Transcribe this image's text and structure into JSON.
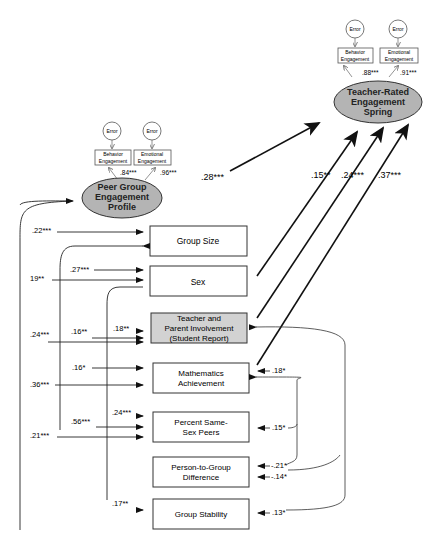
{
  "latent": {
    "peer": {
      "lines": [
        "Peer Group",
        "Engagement",
        "Profile"
      ],
      "fill": "#b4b4b4"
    },
    "teacher": {
      "lines": [
        "Teacher-Rated",
        "Engagement",
        "Spring"
      ],
      "fill": "#b4b4b4"
    }
  },
  "indicators": {
    "peer": [
      {
        "error": "Error",
        "lines": [
          "Behavior",
          "Engagement"
        ],
        "loading": ".84***"
      },
      {
        "error": "Error",
        "lines": [
          "Emotional",
          "Engagement"
        ],
        "loading": ".96***"
      }
    ],
    "teacher": [
      {
        "error": "Error",
        "lines": [
          "Behavior",
          "Engagement"
        ],
        "loading": ".88***"
      },
      {
        "error": "Error",
        "lines": [
          "Emotional",
          "Engagement"
        ],
        "loading": ".91***"
      }
    ]
  },
  "predictors": [
    {
      "lines": [
        "Group Size"
      ],
      "shaded": false
    },
    {
      "lines": [
        "Sex"
      ],
      "shaded": false
    },
    {
      "lines": [
        "Teacher and",
        "Parent Involvement",
        "(Student Report)"
      ],
      "shaded": true,
      "fill": "#d2d2d2"
    },
    {
      "lines": [
        "Mathematics",
        "Achievement"
      ],
      "shaded": false
    },
    {
      "lines": [
        "Percent Same-",
        "Sex Peers"
      ],
      "shaded": false
    },
    {
      "lines": [
        "Person-to-Group",
        "Difference"
      ],
      "shaded": false
    },
    {
      "lines": [
        "Group Stability"
      ],
      "shaded": false
    }
  ],
  "paths": {
    "peer_to_teacher": ".28***",
    "sex_to_teacher": ".15**",
    "involvement_to_teacher": ".24***",
    "math_to_teacher": ".37***"
  },
  "left_correlations": {
    "outer": [
      ".22***",
      "19**",
      ".24***",
      ".36***",
      ".21***"
    ],
    "middle": [
      ".27***",
      ".16**",
      ".16*",
      ".56***"
    ],
    "inner": [
      ".18**",
      ".24***",
      ".17**"
    ]
  },
  "right_correlations": [
    ".18*",
    ".15*",
    "-.21*",
    "-.14*",
    ".13*"
  ]
}
